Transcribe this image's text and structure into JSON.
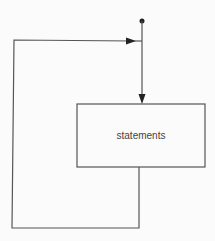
{
  "diagram": {
    "type": "flowchart-loop",
    "nodes": [
      {
        "id": "entry",
        "kind": "entry-point"
      },
      {
        "id": "statements",
        "kind": "process-box",
        "label": "statements"
      }
    ],
    "edges": [
      {
        "from": "entry",
        "to": "statements",
        "arrow": "down"
      },
      {
        "from": "statements",
        "to": "entry",
        "route": "loop-back-left",
        "arrow": "right"
      }
    ],
    "colors": {
      "line": "#555555",
      "background": "#fbfbfb",
      "text": "#444444"
    }
  }
}
